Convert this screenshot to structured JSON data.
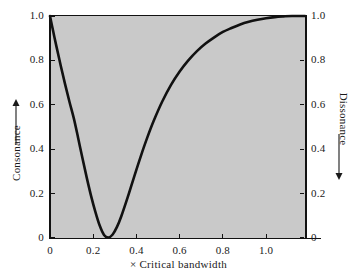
{
  "chart_data": {
    "type": "line",
    "title": "",
    "subtitle": "",
    "xlabel": "× Critical bandwidth",
    "ylabel": "Consonance",
    "ylabel_right": "Dissonance",
    "ylabel_left_arrow": "up-arrow",
    "ylabel_right_arrow": "down-arrow",
    "xlim": [
      0,
      1.18
    ],
    "ylim": [
      0,
      1.0
    ],
    "ylim_right": [
      1.0,
      0
    ],
    "grid": false,
    "legend": null,
    "legend_position": "none",
    "line_color": "#111111",
    "plot_background_color": "#c9c9c9",
    "page_background_color": "#ffffff",
    "xticks": [
      0,
      0.2,
      0.4,
      0.6,
      0.8,
      1.0
    ],
    "xtick_labels": [
      "0",
      "0.2",
      "0.4",
      "0.6",
      "0.8",
      "1.0"
    ],
    "yticks": [
      0,
      0.2,
      0.4,
      0.6,
      0.8,
      1.0
    ],
    "ytick_labels": [
      "0",
      "0.2",
      "0.4",
      "0.6",
      "0.8",
      "1.0"
    ],
    "yticks_right": [
      0,
      0.2,
      0.4,
      0.6,
      0.8,
      1.0
    ],
    "ytick_labels_right": [
      "0",
      "0.2",
      "0.4",
      "0.6",
      "0.8",
      "1.0"
    ],
    "series": [
      {
        "name": "Consonance",
        "x": [
          0.0,
          0.015,
          0.03,
          0.05,
          0.07,
          0.09,
          0.11,
          0.13,
          0.15,
          0.17,
          0.19,
          0.21,
          0.23,
          0.25,
          0.27,
          0.29,
          0.31,
          0.33,
          0.36,
          0.39,
          0.42,
          0.45,
          0.48,
          0.52,
          0.56,
          0.6,
          0.64,
          0.68,
          0.72,
          0.76,
          0.8,
          0.84,
          0.88,
          0.92,
          0.96,
          1.0,
          1.04,
          1.08,
          1.12,
          1.18
        ],
        "y": [
          1.0,
          0.93,
          0.862,
          0.775,
          0.692,
          0.614,
          0.54,
          0.452,
          0.36,
          0.272,
          0.19,
          0.118,
          0.056,
          0.014,
          0.002,
          0.016,
          0.05,
          0.098,
          0.185,
          0.278,
          0.368,
          0.452,
          0.528,
          0.616,
          0.69,
          0.75,
          0.8,
          0.842,
          0.876,
          0.904,
          0.928,
          0.946,
          0.962,
          0.974,
          0.983,
          0.99,
          0.995,
          0.998,
          1.0,
          1.0
        ]
      }
    ],
    "annotations": [
      {
        "text": "curve minimum",
        "x": 0.25,
        "y": 0.0
      },
      {
        "text": "curve start",
        "x": 0.0,
        "y": 1.0
      },
      {
        "text": "curve asymptote",
        "x": 1.18,
        "y": 1.0
      }
    ]
  }
}
